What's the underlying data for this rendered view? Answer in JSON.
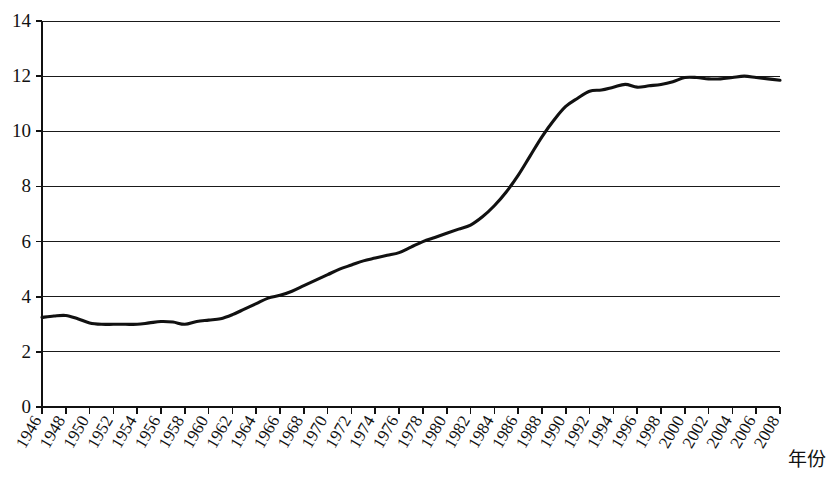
{
  "chart_data": {
    "type": "line",
    "title": "",
    "subtitle": "",
    "xlabel": "年份",
    "ylabel": "",
    "xlim": [
      1946,
      2008
    ],
    "ylim": [
      0,
      14
    ],
    "grid": true,
    "legend": false,
    "legend_position": "none",
    "yticks": [
      0,
      2,
      4,
      6,
      8,
      10,
      12,
      14
    ],
    "ytick_labels": [
      "0",
      "2",
      "4",
      "6",
      "8",
      "10",
      "12",
      "14"
    ],
    "xticks": [
      1946,
      1948,
      1950,
      1952,
      1954,
      1956,
      1958,
      1960,
      1962,
      1964,
      1966,
      1968,
      1970,
      1972,
      1974,
      1976,
      1978,
      1980,
      1982,
      1984,
      1986,
      1988,
      1990,
      1992,
      1994,
      1996,
      1998,
      2000,
      2002,
      2004,
      2006,
      2008
    ],
    "xtick_labels": [
      "1946",
      "1948",
      "1950",
      "1952",
      "1954",
      "1956",
      "1958",
      "1960",
      "1962",
      "1964",
      "1966",
      "1968",
      "1970",
      "1972",
      "1974",
      "1976",
      "1978",
      "1980",
      "1982",
      "1984",
      "1986",
      "1988",
      "1990",
      "1992",
      "1994",
      "1996",
      "1998",
      "2000",
      "2002",
      "2004",
      "2006",
      "2008"
    ],
    "series": [
      {
        "name": "series-1",
        "color": "#111111",
        "x": [
          1946,
          1947,
          1948,
          1949,
          1950,
          1951,
          1952,
          1953,
          1954,
          1955,
          1956,
          1957,
          1958,
          1959,
          1960,
          1961,
          1962,
          1963,
          1964,
          1965,
          1966,
          1967,
          1968,
          1969,
          1970,
          1971,
          1972,
          1973,
          1974,
          1975,
          1976,
          1977,
          1978,
          1979,
          1980,
          1981,
          1982,
          1983,
          1984,
          1985,
          1986,
          1987,
          1988,
          1989,
          1990,
          1991,
          1992,
          1993,
          1994,
          1995,
          1996,
          1997,
          1998,
          1999,
          2000,
          2001,
          2002,
          2003,
          2004,
          2005,
          2006,
          2007,
          2008
        ],
        "values": [
          3.25,
          3.3,
          3.32,
          3.2,
          3.05,
          3.0,
          3.0,
          3.0,
          3.0,
          3.05,
          3.1,
          3.08,
          3.0,
          3.1,
          3.15,
          3.2,
          3.35,
          3.55,
          3.75,
          3.95,
          4.05,
          4.2,
          4.4,
          4.6,
          4.8,
          5.0,
          5.15,
          5.3,
          5.4,
          5.5,
          5.6,
          5.8,
          6.0,
          6.15,
          6.3,
          6.45,
          6.6,
          6.9,
          7.3,
          7.8,
          8.4,
          9.1,
          9.8,
          10.4,
          10.9,
          11.2,
          11.45,
          11.5,
          11.6,
          11.7,
          11.6,
          11.65,
          11.7,
          11.8,
          11.95,
          11.95,
          11.9,
          11.9,
          11.95,
          12.0,
          11.95,
          11.9,
          11.85
        ]
      }
    ]
  },
  "axis": {
    "x_title": "年份"
  }
}
